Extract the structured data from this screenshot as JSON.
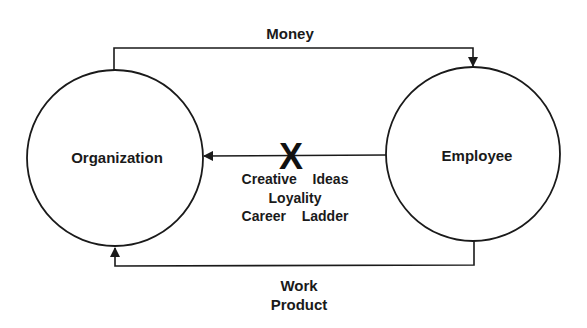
{
  "diagram": {
    "nodes": [
      {
        "id": "organization",
        "label": "Organization",
        "cx": 115,
        "cy": 158,
        "r": 88
      },
      {
        "id": "employee",
        "label": "Employee",
        "cx": 473,
        "cy": 154,
        "r": 87
      }
    ],
    "edges": [
      {
        "id": "money",
        "from": "organization",
        "to": "employee",
        "label": "Money"
      },
      {
        "id": "blocked",
        "from": "employee",
        "to": "organization",
        "blocked": true,
        "block_mark": "X",
        "labels": [
          "Creative  Ideas",
          "Loyality",
          "Career  Ladder"
        ]
      },
      {
        "id": "work-product",
        "from": "employee",
        "to": "organization",
        "label_lines": [
          "Work",
          "Product"
        ]
      }
    ],
    "colors": {
      "line": "#1a1a1a",
      "text": "#1a1a1a",
      "background": "#ffffff"
    }
  }
}
